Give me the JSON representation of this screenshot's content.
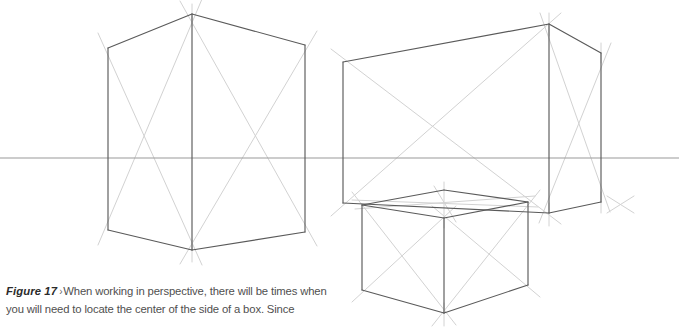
{
  "figure": {
    "label": "Figure 17",
    "separator": "›",
    "caption_text": "When working in perspective, there will be times when you will need to locate the center of the side of a box. Since",
    "colors": {
      "background": "#ffffff",
      "edge_stroke": "#5a5a5a",
      "construction_stroke": "#d2d2d2",
      "horizon_stroke": "#9a9a9a",
      "caption_label": "#2b2b2b",
      "caption_body": "#4f4f4f"
    }
  },
  "drawing": {
    "type": "two-point-perspective-construction",
    "description": "Three rectangular boxes drawn in two-point perspective with light diagonal construction lines crossing each visible face to locate face centers, plus a horizon line.",
    "horizon_line": {
      "name": "horizon-line",
      "y": 158,
      "segments": [
        {
          "x1": 0,
          "x2": 679
        }
      ]
    },
    "boxes": [
      {
        "name": "left-cube",
        "vertices": {
          "top_left": [
            108,
            48
          ],
          "top_front": [
            192,
            14
          ],
          "top_right": [
            305,
            45
          ],
          "bottom_left": [
            108,
            230
          ],
          "bottom_front": [
            192,
            250
          ],
          "bottom_right": [
            305,
            232
          ]
        },
        "faces": [
          {
            "name": "left-face",
            "corners": [
              "top_left",
              "top_front",
              "bottom_front",
              "bottom_left"
            ],
            "has_diagonals": true
          },
          {
            "name": "right-face",
            "corners": [
              "top_front",
              "top_right",
              "bottom_right",
              "bottom_front"
            ],
            "has_diagonals": true
          }
        ]
      },
      {
        "name": "right-wide-box",
        "vertices": {
          "top_left": [
            343,
            62
          ],
          "top_front": [
            549,
            24
          ],
          "top_right": [
            601,
            53
          ],
          "bottom_left": [
            343,
            203
          ],
          "bottom_front": [
            549,
            213
          ],
          "bottom_right": [
            601,
            202
          ]
        },
        "faces": [
          {
            "name": "left-face",
            "corners": [
              "top_left",
              "top_front",
              "bottom_front",
              "bottom_left"
            ],
            "has_diagonals": true
          },
          {
            "name": "right-face",
            "corners": [
              "top_front",
              "top_right",
              "bottom_right",
              "bottom_front"
            ],
            "has_diagonals": true
          }
        ]
      },
      {
        "name": "bottom-small-box",
        "vertices": {
          "top_left": [
            362,
            205
          ],
          "top_front": [
            444,
            218
          ],
          "top_right": [
            528,
            202
          ],
          "top_back": [
            444,
            190
          ],
          "bottom_left": [
            362,
            290
          ],
          "bottom_front": [
            444,
            313
          ],
          "bottom_right": [
            528,
            285
          ]
        },
        "faces": [
          {
            "name": "top-face",
            "corners": [
              "top_left",
              "top_back",
              "top_right",
              "top_front"
            ],
            "has_diagonals": true
          },
          {
            "name": "left-face",
            "corners": [
              "top_left",
              "top_front",
              "bottom_front",
              "bottom_left"
            ],
            "has_diagonals": true
          },
          {
            "name": "right-face",
            "corners": [
              "top_front",
              "top_right",
              "bottom_right",
              "bottom_front"
            ],
            "has_diagonals": true
          }
        ]
      }
    ]
  }
}
